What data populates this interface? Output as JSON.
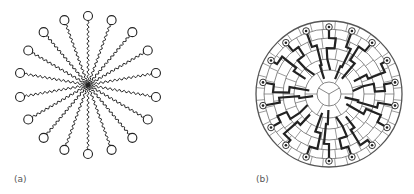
{
  "figure": {
    "panels": [
      {
        "id": "a",
        "label": "(a)",
        "description": "Spherical micelle schematic: 18 surfactant molecules with wavy hydrocarbon tails meeting at center and circular polar heads on the outside",
        "center": [
          88,
          85
        ],
        "radius": 69,
        "head_count": 18,
        "head_radius": 4.5
      },
      {
        "id": "b",
        "label": "(b)",
        "description": "Lattice model cross-section of a micelle: circular grid of concentric rings and radial spokes, with bold chain paths running from circled head groups at the rim toward the center",
        "center": [
          329,
          94
        ],
        "radius": 73,
        "ring_count": 6,
        "spoke_count": 24
      }
    ],
    "colors": {
      "ink": "#222222",
      "grid": "#555555",
      "label": "#555555",
      "background": "#ffffff"
    }
  }
}
